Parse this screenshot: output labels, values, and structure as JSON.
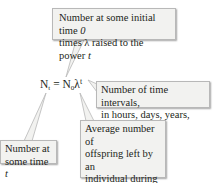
{
  "equation": {
    "lhs_base": "N",
    "lhs_sub": "t",
    "equals": "=",
    "rhs_base": "N",
    "rhs_sub": "0",
    "lambda": "λ",
    "exponent": "t"
  },
  "callouts": {
    "initial": {
      "line1_prefix": "Number at some initial time ",
      "line1_italic": "0",
      "line2_prefix": "times λ raised to the power ",
      "line2_italic": "t"
    },
    "intervals": {
      "line1": "Number of time intervals,",
      "line2": "in hours, days, years, etc."
    },
    "at_time_t": {
      "line1": "Number at",
      "line2_prefix": "some time ",
      "line2_italic": "t"
    },
    "offspring": {
      "line1": "Average number of",
      "line2": "offspring left by an",
      "line3": "individual during one",
      "line4": "time interval"
    }
  },
  "colors": {
    "callout_fill": "#f2f2f0",
    "callout_border": "#b8b8b8",
    "text": "#231f20"
  }
}
